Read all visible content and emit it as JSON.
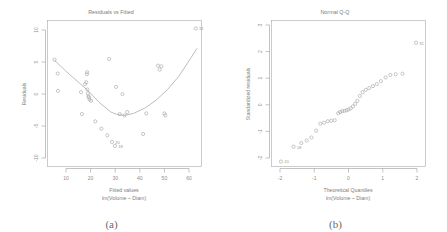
{
  "figure": {
    "panels": [
      {
        "caption": "(a)",
        "title": "Residuals vs Fitted",
        "xlabel_line1": "Fitted values",
        "xlabel_line2": "lm(Volume ~ Diam)",
        "ylabel": "Residuals"
      },
      {
        "caption": "(b)",
        "title": "Normal Q-Q",
        "xlabel_line1": "Theoretical Quantiles",
        "xlabel_line2": "lm(Volume ~ Diam)",
        "ylabel": "Standardized residuals"
      }
    ]
  },
  "chart_data": [
    {
      "type": "scatter",
      "title": "Residuals vs Fitted",
      "xlabel": "Fitted values  lm(Volume ~ Diam)",
      "ylabel": "Residuals",
      "xlim": [
        2,
        70
      ],
      "ylim": [
        -11,
        11
      ],
      "xticks": [
        10,
        20,
        30,
        40,
        50,
        60
      ],
      "yticks": [
        -10,
        -5,
        0,
        5,
        10
      ],
      "grid": false,
      "legend": "none",
      "x": [
        5.1,
        6.5,
        6.6,
        16.8,
        17.2,
        18.6,
        19.1,
        19.4,
        19.5,
        19.6,
        19.8,
        20.1,
        20.3,
        20.6,
        21.2,
        23.1,
        25.8,
        28.4,
        29.2,
        30.5,
        31.8,
        32.3,
        33.9,
        35.1,
        36.0,
        37.2,
        44.2,
        45.6,
        50.8,
        51.5,
        52.3,
        53.6,
        54.0,
        67.5
      ],
      "y": [
        5.1,
        3.0,
        0.4,
        0.2,
        -3.1,
        1.4,
        1.7,
        2.9,
        3.2,
        0.6,
        0.0,
        -0.4,
        -0.6,
        -0.9,
        -1.1,
        -4.2,
        -5.3,
        -6.3,
        5.2,
        -7.3,
        -7.9,
        1.0,
        -3.1,
        -0.1,
        -3.3,
        -2.8,
        -6.1,
        -3.0,
        4.2,
        3.6,
        4.1,
        -3.0,
        -3.3,
        9.8
      ],
      "point_labels": [
        {
          "label": "31",
          "x": 67.5,
          "y": 9.8
        },
        {
          "label": "18",
          "x": 31.8,
          "y": -7.9
        },
        {
          "label": "20",
          "x": 30.5,
          "y": -7.3
        }
      ],
      "smoother": {
        "type": "loess",
        "x": [
          5.1,
          10,
          15,
          20,
          25,
          30,
          33,
          36,
          40,
          45,
          50,
          55,
          60,
          65,
          68
        ],
        "y": [
          5.0,
          3.4,
          1.9,
          0.4,
          -1.4,
          -2.8,
          -3.2,
          -3.3,
          -3.0,
          -2.2,
          -1.0,
          0.6,
          2.6,
          5.2,
          6.8
        ]
      }
    },
    {
      "type": "scatter",
      "title": "Normal Q-Q",
      "xlabel": "Theoretical Quantiles  lm(Volume ~ Diam)",
      "ylabel": "Standardized residuals",
      "xlim": [
        -2.45,
        2.45
      ],
      "ylim": [
        -2.55,
        3.35
      ],
      "xticks": [
        -2,
        -1,
        0,
        1,
        2
      ],
      "yticks": [
        -2,
        -1,
        0,
        1,
        2,
        3
      ],
      "grid": false,
      "legend": "none",
      "x": [
        -2.15,
        -1.75,
        -1.5,
        -1.33,
        -1.18,
        -1.03,
        -0.9,
        -0.78,
        -0.66,
        -0.55,
        -0.44,
        -0.33,
        -0.27,
        -0.2,
        -0.13,
        -0.06,
        0.0,
        0.07,
        0.14,
        0.21,
        0.28,
        0.36,
        0.45,
        0.55,
        0.66,
        0.78,
        0.9,
        1.03,
        1.18,
        1.33,
        1.5,
        1.72,
        2.15
      ],
      "y": [
        -2.35,
        -1.75,
        -1.6,
        -1.5,
        -1.38,
        -1.1,
        -0.82,
        -0.78,
        -0.72,
        -0.7,
        -0.68,
        -0.4,
        -0.35,
        -0.32,
        -0.3,
        -0.28,
        -0.25,
        -0.2,
        -0.12,
        -0.02,
        0.1,
        0.3,
        0.45,
        0.55,
        0.62,
        0.7,
        0.78,
        0.9,
        1.05,
        1.15,
        1.18,
        1.2,
        2.45
      ],
      "point_labels": [
        {
          "label": "31",
          "x": 2.15,
          "y": 2.45
        },
        {
          "label": "20",
          "x": -2.15,
          "y": -2.35
        },
        {
          "label": "18",
          "x": -1.75,
          "y": -1.75
        }
      ]
    }
  ]
}
